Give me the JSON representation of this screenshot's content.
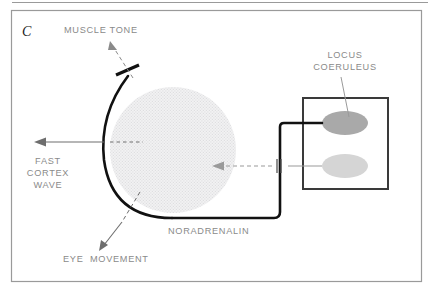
{
  "figure": {
    "panel_letter": "C",
    "background_color": "#ffffff",
    "frame_color": "#9a9a9a",
    "label_color": "#8a8a8a"
  },
  "labels": {
    "muscle_tone": "MUSCLE TONE",
    "fast_cortex_wave_line1": "FAST",
    "fast_cortex_wave_line2": "CORTEX",
    "fast_cortex_wave_line3": "WAVE",
    "eye_movement": "EYE  MOVEMENT",
    "noradrenalin": "NORADRENALIN",
    "locus_coeruleus_line1": "LOCUS",
    "locus_coeruleus_line2": "COERULEUS"
  },
  "elements": {
    "reticular_disk": {
      "name": "reticular-formation-disk",
      "fill": "#ececed",
      "cx": 173,
      "cy": 150,
      "r": 63
    },
    "locus_box": {
      "name": "locus-coeruleus-box",
      "stroke": "#3a3a3a",
      "x": 303,
      "y": 98,
      "width": 85,
      "height": 91
    },
    "nucleus_upper": {
      "name": "locus-coeruleus-nucleus-upper",
      "fill": "#a9a9a9",
      "cx": 345,
      "cy": 123,
      "rx": 23,
      "ry": 12
    },
    "nucleus_lower": {
      "name": "locus-coeruleus-nucleus-lower",
      "fill": "#d5d5d5",
      "cx": 345,
      "cy": 166,
      "rx": 23,
      "ry": 12
    },
    "noradrenalin_pathway": {
      "name": "noradrenalin-pathway",
      "stroke": "#111111",
      "width": 2.6
    },
    "inhibition_mark": {
      "name": "inhibition-mark",
      "stroke": "#555555"
    }
  }
}
